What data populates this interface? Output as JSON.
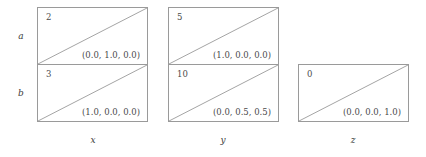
{
  "diagram": {
    "type": "grid-table",
    "row_labels": [
      "a",
      "b"
    ],
    "col_labels": [
      "x",
      "y",
      "z"
    ],
    "colors": {
      "border": "#9a9a9a",
      "text": "#4a4a4a",
      "label": "#3c3c3c",
      "diagonal": "#9a9a9a",
      "background": "#ffffff"
    },
    "cells": [
      {
        "row": "a",
        "col": "x",
        "id": "2",
        "tuple": "(0.0, 1.0, 0.0)",
        "diagonal": "bottom-left-to-top-right"
      },
      {
        "row": "a",
        "col": "y",
        "id": "5",
        "tuple": "(1.0, 0.0, 0.0)",
        "diagonal": "bottom-left-to-top-right"
      },
      {
        "row": "b",
        "col": "x",
        "id": "3",
        "tuple": "(1.0, 0.0, 0.0)",
        "diagonal": "bottom-left-to-top-right"
      },
      {
        "row": "b",
        "col": "y",
        "id": "10",
        "tuple": "(0.0, 0.5, 0.5)",
        "diagonal": "bottom-left-to-top-right"
      },
      {
        "row": "b",
        "col": "z",
        "id": "0",
        "tuple": "(0.0, 0.0, 1.0)",
        "diagonal": "bottom-left-to-top-right"
      }
    ]
  }
}
